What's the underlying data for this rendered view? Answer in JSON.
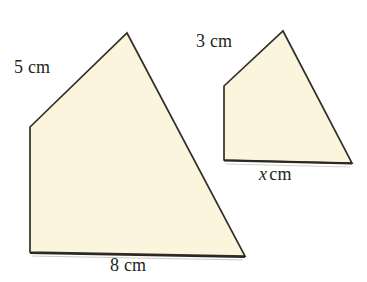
{
  "figure": {
    "type": "geometry-diagram",
    "background_color": "#ffffff",
    "fill_color": "#faf5dc",
    "stroke_color": "#332e28",
    "stroke_width": 1.6,
    "canvas": {
      "width": 367,
      "height": 282
    }
  },
  "shapes": [
    {
      "id": "large-quadrilateral",
      "name": "large-quadrilateral",
      "points": "127,33 245,256 30,252 30,127",
      "vertices": [
        {
          "x": 127,
          "y": 33
        },
        {
          "x": 245,
          "y": 256
        },
        {
          "x": 30,
          "y": 252
        },
        {
          "x": 30,
          "y": 127
        }
      ]
    },
    {
      "id": "small-quadrilateral",
      "name": "small-quadrilateral",
      "points": "283,31 352,163 224,160 224,86",
      "vertices": [
        {
          "x": 283,
          "y": 31
        },
        {
          "x": 352,
          "y": 163
        },
        {
          "x": 224,
          "y": 160
        },
        {
          "x": 224,
          "y": 86
        }
      ]
    }
  ],
  "labels": {
    "large_left_side": {
      "value": "5",
      "unit": "cm",
      "text": "5 cm"
    },
    "large_bottom_side": {
      "value": "8",
      "unit": "cm",
      "text": "8 cm"
    },
    "small_left_side": {
      "value": "3",
      "unit": "cm",
      "text": "3 cm"
    },
    "small_bottom_side": {
      "value": "x",
      "unit": "cm",
      "text": "x cm"
    }
  }
}
